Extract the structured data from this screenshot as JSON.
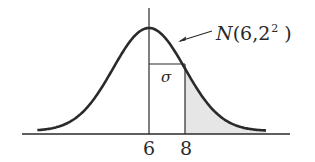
{
  "figure": {
    "distribution_label": {
      "name": "N",
      "open": "(",
      "mean": "6",
      "sep": ",",
      "sd": "2",
      "power": "2",
      "close": ")"
    },
    "sigma_label": "σ",
    "tick_labels": [
      "6",
      "8"
    ],
    "colors": {
      "ink": "#2a2a2a",
      "shade": "#e6e6e6",
      "background": "#ffffff"
    }
  },
  "chart_data": {
    "type": "area",
    "distribution": "normal",
    "mean": 6,
    "sd": 2,
    "variance": 4,
    "xlabel": "",
    "ylabel": "",
    "x_ticks": [
      6,
      8
    ],
    "shaded_region": {
      "from": 8,
      "to": "inf",
      "meaning": "P(X > 8) = P(Z > 1)"
    },
    "annotations": [
      "N(6,2²)",
      "σ between x=6 and x=8"
    ],
    "grid": false,
    "legend": "none"
  }
}
